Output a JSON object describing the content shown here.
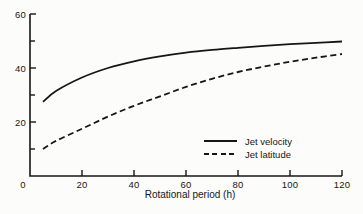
{
  "chart_data": {
    "type": "line",
    "title": "",
    "xlabel": "Rotational period (h)",
    "ylabel": "",
    "xlim": [
      0,
      120
    ],
    "ylim": [
      0,
      60
    ],
    "x_ticks": [
      0,
      20,
      40,
      60,
      80,
      100,
      120
    ],
    "y_major_ticks": [
      20,
      40,
      60
    ],
    "y_minor_ticks": [
      10,
      30,
      50
    ],
    "origin_label": "0",
    "grid": false,
    "legend_position": "inside-lower-right",
    "x": [
      5,
      10,
      20,
      30,
      40,
      50,
      60,
      70,
      80,
      90,
      100,
      110,
      120
    ],
    "series": [
      {
        "name": "Jet velocity",
        "style": "solid",
        "color": "#161616",
        "values": [
          27.5,
          31.5,
          36.5,
          40.0,
          42.5,
          44.3,
          45.7,
          46.7,
          47.5,
          48.2,
          48.8,
          49.3,
          49.8
        ]
      },
      {
        "name": "Jet latitude",
        "style": "dashed",
        "color": "#161616",
        "values": [
          10.0,
          13.0,
          17.5,
          22.0,
          26.0,
          29.5,
          33.0,
          36.0,
          38.5,
          40.5,
          42.3,
          43.8,
          45.2
        ]
      }
    ]
  },
  "legend": {
    "items": [
      {
        "label": "Jet velocity",
        "style": "solid"
      },
      {
        "label": "Jet latitude",
        "style": "dashed"
      }
    ]
  },
  "colors": {
    "line": "#161616",
    "background": "#fcfcfa"
  }
}
